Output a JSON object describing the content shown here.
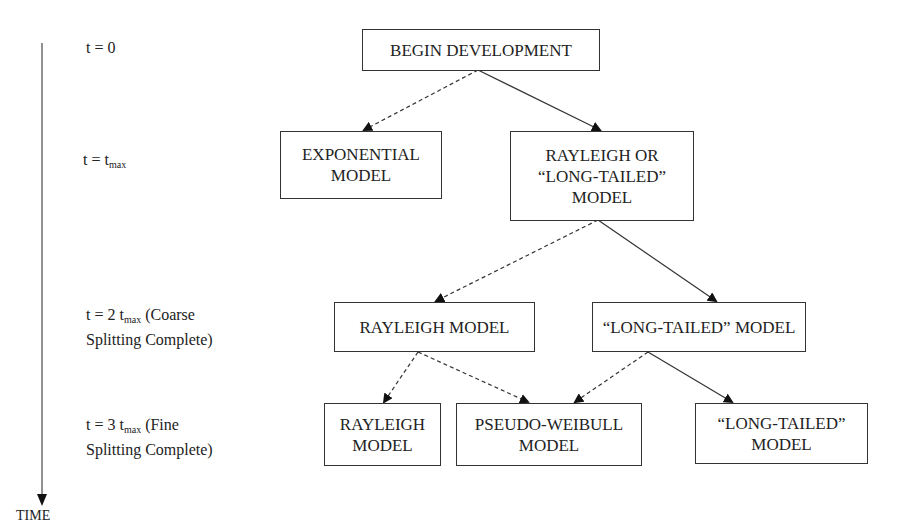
{
  "diagram": {
    "axis": {
      "label": "TIME"
    },
    "time_labels": [
      {
        "id": "t0",
        "prefix": "t = 0",
        "sub": "",
        "suffix": "",
        "line2": ""
      },
      {
        "id": "t1",
        "prefix": "t = t",
        "sub": "max",
        "suffix": "",
        "line2": ""
      },
      {
        "id": "t2",
        "prefix": "t = 2 t",
        "sub": "max",
        "suffix": " (Coarse",
        "line2": "Splitting Complete)"
      },
      {
        "id": "t3",
        "prefix": "t = 3 t",
        "sub": "max",
        "suffix": " (Fine",
        "line2": "Splitting Complete)"
      }
    ],
    "nodes": [
      {
        "id": "begin",
        "label": "BEGIN DEVELOPMENT"
      },
      {
        "id": "exponential",
        "label": "EXPONENTIAL\nMODEL"
      },
      {
        "id": "rayleigh_or_long",
        "label": "RAYLEIGH OR\n“LONG-TAILED”\nMODEL"
      },
      {
        "id": "rayleigh_coarse",
        "label": "RAYLEIGH MODEL"
      },
      {
        "id": "long_coarse",
        "label": "“LONG-TAILED” MODEL"
      },
      {
        "id": "rayleigh_fine",
        "label": "RAYLEIGH\nMODEL"
      },
      {
        "id": "pseudo_weibull",
        "label": "PSEUDO-WEIBULL\nMODEL"
      },
      {
        "id": "long_fine",
        "label": "“LONG-TAILED”\nMODEL"
      }
    ],
    "edges": [
      {
        "from": "begin",
        "to": "exponential",
        "style": "dashed"
      },
      {
        "from": "begin",
        "to": "rayleigh_or_long",
        "style": "solid"
      },
      {
        "from": "rayleigh_or_long",
        "to": "rayleigh_coarse",
        "style": "dashed"
      },
      {
        "from": "rayleigh_or_long",
        "to": "long_coarse",
        "style": "solid"
      },
      {
        "from": "rayleigh_coarse",
        "to": "rayleigh_fine",
        "style": "dashed"
      },
      {
        "from": "rayleigh_coarse",
        "to": "pseudo_weibull",
        "style": "dashed"
      },
      {
        "from": "long_coarse",
        "to": "pseudo_weibull",
        "style": "dashed"
      },
      {
        "from": "long_coarse",
        "to": "long_fine",
        "style": "solid"
      }
    ]
  }
}
